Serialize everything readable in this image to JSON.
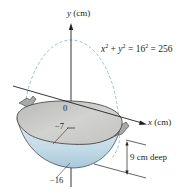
{
  "diagram": {
    "type": "wok-cross-section",
    "y_axis": {
      "variable": "y",
      "unit_label": "(cm)"
    },
    "x_axis": {
      "variable": "x",
      "unit_label": "(cm)"
    },
    "equation": {
      "x_var": "x",
      "y_var": "y",
      "exp": "2",
      "plus": "+",
      "eq1": "= 16",
      "eq2": "= 256"
    },
    "labels": {
      "origin": "0",
      "rim_level": "−7",
      "bottom": "−16",
      "depth": "9 cm deep"
    },
    "colors": {
      "axis": "#231f20",
      "dashed_circle": "#8fb8cf",
      "wok_interior": "#c9c9c7",
      "wok_body": "#cfe3ee",
      "wok_body_dark": "#a9c8d9",
      "handle": "#a8a8a6",
      "outline": "#3a3a3a"
    }
  }
}
